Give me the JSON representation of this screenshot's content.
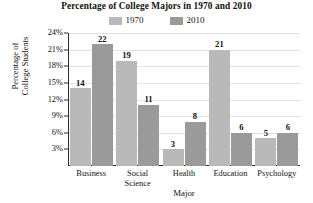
{
  "chart_data": {
    "type": "bar",
    "title": "Percentage of College Majors in 1970 and 2010",
    "xlabel": "Major",
    "ylabel": "Percentage of College Students",
    "ylabel_line1": "Percentage of",
    "ylabel_line2": "College Students",
    "categories": [
      "Business",
      "Social Science",
      "Health",
      "Education",
      "Psychology"
    ],
    "category_labels": [
      {
        "line1": "Business",
        "line2": ""
      },
      {
        "line1": "Social",
        "line2": "Science"
      },
      {
        "line1": "Health",
        "line2": ""
      },
      {
        "line1": "Education",
        "line2": ""
      },
      {
        "line1": "Psychology",
        "line2": ""
      }
    ],
    "series": [
      {
        "name": "1970",
        "color": "#b9b9b9",
        "values": [
          14,
          19,
          3,
          21,
          5
        ]
      },
      {
        "name": "2010",
        "color": "#9a9a9a",
        "values": [
          22,
          11,
          8,
          6,
          6
        ]
      }
    ],
    "yticks": [
      3,
      6,
      9,
      12,
      15,
      18,
      21,
      24
    ],
    "ytick_labels": [
      "3%",
      "6%",
      "9%",
      "12%",
      "15%",
      "18%",
      "21%",
      "24%"
    ],
    "ylim": [
      0,
      24
    ],
    "grid": true,
    "legend_position": "top-center",
    "value_labels": true
  },
  "legend": {
    "items": [
      {
        "label": "1970",
        "color": "#b9b9b9"
      },
      {
        "label": "2010",
        "color": "#9a9a9a"
      }
    ]
  }
}
